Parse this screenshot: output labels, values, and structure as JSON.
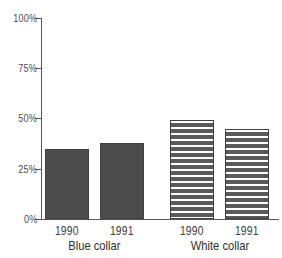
{
  "chart_data": {
    "type": "bar",
    "title": "",
    "xlabel": "",
    "ylabel": "",
    "ylim": [
      0,
      100
    ],
    "y_unit": "%",
    "grid": false,
    "legend": "none",
    "y_ticks": [
      {
        "value": 100,
        "label": "100%"
      },
      {
        "value": 75,
        "label": "75%"
      },
      {
        "value": 50,
        "label": "50%"
      },
      {
        "value": 25,
        "label": "25%"
      },
      {
        "value": 0,
        "label": "0%"
      }
    ],
    "groups": [
      {
        "label": "Blue collar",
        "style": "solid"
      },
      {
        "label": "White collar",
        "style": "hatched"
      }
    ],
    "categories": [
      "1990",
      "1991",
      "1990",
      "1991"
    ],
    "values": [
      35,
      38,
      49.5,
      45
    ],
    "bars": [
      {
        "group": "Blue collar",
        "category": "1990",
        "value": 35,
        "style": "solid"
      },
      {
        "group": "Blue collar",
        "category": "1991",
        "value": 38,
        "style": "solid"
      },
      {
        "group": "White collar",
        "category": "1990",
        "value": 49.5,
        "style": "hatched"
      },
      {
        "group": "White collar",
        "category": "1991",
        "value": 45,
        "style": "hatched"
      }
    ]
  },
  "axis": {
    "tick_100": "100%",
    "tick_75": "75%",
    "tick_50": "50%",
    "tick_25": "25%",
    "tick_0": "0%"
  },
  "bar_labels": {
    "b1": "1990",
    "b2": "1991",
    "b3": "1990",
    "b4": "1991"
  },
  "group_labels": {
    "g1": "Blue collar",
    "g2": "White collar"
  },
  "colors": {
    "bar_solid": "#4c4c4c",
    "bar_hatch": "#5a5a5a",
    "hatch_line": "#ffffff",
    "axis": "#555555",
    "text": "#3d3d3d",
    "background": "#ffffff"
  }
}
